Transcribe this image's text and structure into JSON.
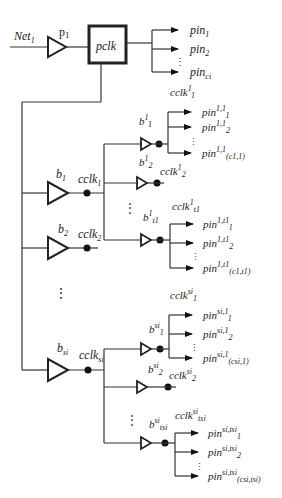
{
  "diagram": {
    "type": "clock-tree",
    "input": {
      "label": "Net",
      "sub": "1"
    },
    "primary_buffer": {
      "label": "p",
      "sub": "1"
    },
    "pclk_box": {
      "label": "pclk"
    },
    "pclk_pins": [
      {
        "label": "pin",
        "sub": "1"
      },
      {
        "label": "pin",
        "sub": "2"
      },
      {
        "label": "pin",
        "sub": "ci"
      }
    ],
    "level1": [
      {
        "buffer": {
          "label": "b",
          "sub": "1"
        },
        "clk": {
          "label": "cclk",
          "sub": "1"
        }
      },
      {
        "buffer": {
          "label": "b",
          "sub": "2"
        },
        "clk": {
          "label": "cclk",
          "sub": "2"
        }
      },
      {
        "buffer": {
          "label": "b",
          "sub": "si"
        },
        "clk": {
          "label": "cclk",
          "sub": "si"
        }
      }
    ],
    "branch_1": {
      "sub_buffers": [
        {
          "label": "b",
          "sup": "1",
          "sub": "1",
          "clk": {
            "label": "cclk",
            "sup": "1",
            "sub": "1"
          },
          "pins": [
            {
              "label": "pin",
              "sup": "1,1",
              "sub": "1"
            },
            {
              "label": "pin",
              "sup": "1,1",
              "sub": "2"
            },
            {
              "label": "pin",
              "sup": "1,1",
              "sub": "(c1,1)"
            }
          ]
        },
        {
          "label": "b",
          "sup": "1",
          "sub": "2",
          "clk": {
            "label": "cclk",
            "sup": "1",
            "sub": "2"
          }
        },
        {
          "label": "b",
          "sup": "1",
          "sub": "t1",
          "clk": {
            "label": "cclk",
            "sup": "1",
            "sub": "t1"
          },
          "pins": [
            {
              "label": "pin",
              "sup": "1,t1",
              "sub": "1"
            },
            {
              "label": "pin",
              "sup": "1,t1",
              "sub": "2"
            },
            {
              "label": "pin",
              "sup": "1,t1",
              "sub": "(c1,t1)"
            }
          ]
        }
      ]
    },
    "branch_si": {
      "sub_buffers": [
        {
          "label": "b",
          "sup": "si",
          "sub": "1",
          "clk": {
            "label": "cclk",
            "sup": "si",
            "sub": "1"
          },
          "pins": [
            {
              "label": "pin",
              "sup": "si,1",
              "sub": "1"
            },
            {
              "label": "pin",
              "sup": "si,1",
              "sub": "2"
            },
            {
              "label": "pin",
              "sup": "si,1",
              "sub": "(csi,1)"
            }
          ]
        },
        {
          "label": "b",
          "sup": "si",
          "sub": "2",
          "clk": {
            "label": "cclk",
            "sup": "si",
            "sub": "2"
          }
        },
        {
          "label": "b",
          "sup": "si",
          "sub": "tsi",
          "clk": {
            "label": "cclk",
            "sup": "si",
            "sub": "tsi"
          },
          "pins": [
            {
              "label": "pin",
              "sup": "si,tsi",
              "sub": "1"
            },
            {
              "label": "pin",
              "sup": "si,tsi",
              "sub": "2"
            },
            {
              "label": "pin",
              "sup": "si,tsi",
              "sub": "(csi,tsi)"
            }
          ]
        }
      ]
    },
    "ellipsis": "⋮"
  }
}
